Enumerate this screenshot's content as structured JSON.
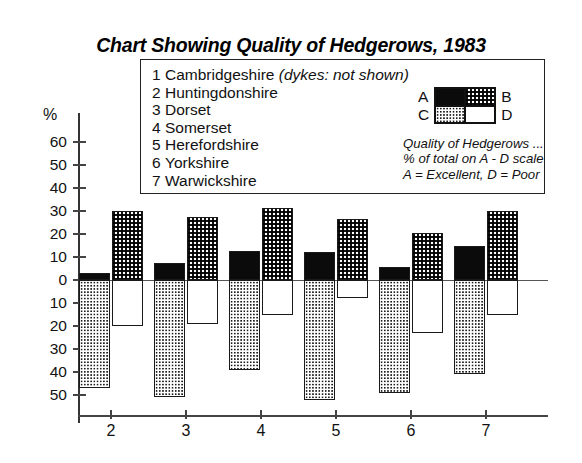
{
  "title": "Chart Showing Quality of Hedgerows, 1983",
  "legend": {
    "counties": [
      {
        "num": "1",
        "name": "Cambridgeshire",
        "note": "(dykes: not shown)"
      },
      {
        "num": "2",
        "name": "Huntingdonshire",
        "note": ""
      },
      {
        "num": "3",
        "name": "Dorset",
        "note": ""
      },
      {
        "num": "4",
        "name": "Somerset",
        "note": ""
      },
      {
        "num": "5",
        "name": "Herefordshire",
        "note": ""
      },
      {
        "num": "6",
        "name": "Yorkshire",
        "note": ""
      },
      {
        "num": "7",
        "name": "Warwickshire",
        "note": ""
      }
    ],
    "swatch_labels": {
      "a": "A",
      "b": "B",
      "c": "C",
      "d": "D"
    },
    "caption_lines": [
      "Quality of Hedgerows ...",
      "% of total on A - D scale",
      "A = Excellent, D = Poor"
    ]
  },
  "axis": {
    "y_title": "%",
    "y_ticks": [
      "60",
      "50",
      "40",
      "30",
      "20",
      "10",
      "0",
      "10",
      "20",
      "30",
      "40",
      "50"
    ],
    "x_ticks": [
      "2",
      "3",
      "4",
      "5",
      "6",
      "7"
    ]
  },
  "colors": {
    "ink": "#111111",
    "frame": "#1a1a1a",
    "paper": "#ffffff"
  },
  "chart_data": {
    "type": "bar",
    "title": "Chart Showing Quality of Hedgerows, 1983",
    "subtitle": "Quality of Hedgerows ... % of total on A - D scale. A = Excellent, D = Poor",
    "xlabel": "",
    "ylabel": "%",
    "ylim": [
      -50,
      60
    ],
    "grid": false,
    "legend_position": "inside-top-right",
    "note": "Diverging stacked/paired bars: A and B plotted upward, C and D plotted downward. Left bar of each pair = A (above) / C (below); right bar = B (above) / D (below). Below-axis tick labels are shown as positive magnitudes.",
    "categories": [
      "2",
      "3",
      "4",
      "5",
      "6",
      "7"
    ],
    "category_names": [
      "Huntingdonshire",
      "Dorset",
      "Somerset",
      "Herefordshire",
      "Yorkshire",
      "Warwickshire"
    ],
    "series": [
      {
        "name": "A = Excellent",
        "key": "A",
        "direction": "up",
        "fill": "solid-black",
        "values": [
          3,
          7.5,
          12.5,
          12,
          5.5,
          15
        ]
      },
      {
        "name": "B",
        "key": "B",
        "direction": "up",
        "fill": "checkerboard",
        "values": [
          30,
          27.5,
          31.5,
          26.5,
          20.5,
          30
        ]
      },
      {
        "name": "C",
        "key": "C",
        "direction": "down",
        "fill": "light-dotted",
        "values": [
          -47,
          -51,
          -39,
          -52,
          -49,
          -41
        ]
      },
      {
        "name": "D = Poor",
        "key": "D",
        "direction": "down",
        "fill": "white",
        "values": [
          -20,
          -19,
          -15,
          -8,
          -23,
          -15
        ]
      }
    ]
  }
}
